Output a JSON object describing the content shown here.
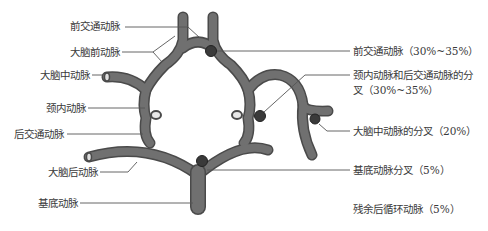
{
  "figure": {
    "colors": {
      "vessel": "#6e6e6e",
      "vessel_edge": "#4a4a4a",
      "aneurysm": "#3a3a3a",
      "leader": "#555555",
      "background": "#ffffff"
    }
  },
  "left_labels": [
    {
      "id": "acom",
      "text": "前交通动脉"
    },
    {
      "id": "aca",
      "text": "大脑前动脉"
    },
    {
      "id": "mca",
      "text": "大脑中动脉"
    },
    {
      "id": "ica",
      "text": "颈内动脉"
    },
    {
      "id": "pcom",
      "text": "后交通动脉"
    },
    {
      "id": "pca",
      "text": "大脑后动脉"
    },
    {
      "id": "ba",
      "text": "基底动脉"
    }
  ],
  "right_labels": [
    {
      "id": "acom_pct",
      "text": "前交通动脉（30%~35%）"
    },
    {
      "id": "ica_pcom_pct_line1",
      "text": "颈内动脉和后交通动脉的分"
    },
    {
      "id": "ica_pcom_pct_line2",
      "text": "叉（30%~35%）"
    },
    {
      "id": "mca_bif_pct",
      "text": "大脑中动脉的分叉（20%）"
    },
    {
      "id": "ba_bif_pct",
      "text": "基底动脉分叉（5%）"
    },
    {
      "id": "posterior_rest_pct",
      "text": "残余后循环动脉（5%）"
    }
  ]
}
